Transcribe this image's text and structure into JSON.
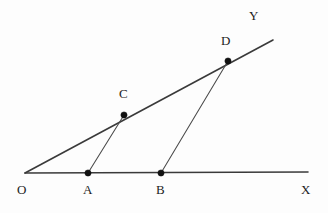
{
  "figure": {
    "canvas": {
      "width": 328,
      "height": 213,
      "background": "#fdfdfd"
    },
    "colors": {
      "ray_stroke": "#3a3a3a",
      "segment_stroke": "#4a4a4a",
      "dot_fill": "#111111",
      "label_color": "#1c1c1c"
    },
    "labels": {
      "origin": "O",
      "point_a": "A",
      "point_b": "B",
      "point_c": "C",
      "point_d": "D",
      "axis_x": "X",
      "axis_y": "Y"
    },
    "points": [
      {
        "name": "O",
        "x": 25,
        "y": 173,
        "dot": false,
        "label_x": 17,
        "label_y": 183
      },
      {
        "name": "A",
        "x": 88,
        "y": 173,
        "dot": true,
        "label_x": 83,
        "label_y": 183
      },
      {
        "name": "B",
        "x": 161,
        "y": 173,
        "dot": true,
        "label_x": 156,
        "label_y": 183
      },
      {
        "name": "C",
        "x": 124,
        "y": 115,
        "dot": true,
        "label_x": 119,
        "label_y": 87
      },
      {
        "name": "D",
        "x": 228,
        "y": 61,
        "dot": true,
        "label_x": 221,
        "label_y": 34
      },
      {
        "name": "X",
        "x": 308,
        "y": 172,
        "dot": false,
        "label_x": 301,
        "label_y": 183
      },
      {
        "name": "Y",
        "x": 273,
        "y": 40,
        "dot": false,
        "label_x": 249,
        "label_y": 9
      }
    ],
    "lines": [
      {
        "name": "ray-ox",
        "kind": "ray",
        "from": "O",
        "to": "X",
        "x1": 25,
        "y1": 173,
        "x2": 308,
        "y2": 172
      },
      {
        "name": "ray-oy",
        "kind": "ray",
        "from": "O",
        "to": "Y",
        "x1": 25,
        "y1": 173,
        "x2": 273,
        "y2": 40
      },
      {
        "name": "segment-ac",
        "kind": "segment",
        "from": "A",
        "to": "C",
        "x1": 88,
        "y1": 173,
        "x2": 124,
        "y2": 115
      },
      {
        "name": "segment-bd",
        "kind": "segment",
        "from": "B",
        "to": "D",
        "x1": 161,
        "y1": 173,
        "x2": 228,
        "y2": 61
      }
    ],
    "dot_radius": 3.1
  }
}
